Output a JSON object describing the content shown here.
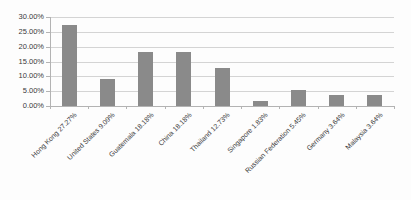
{
  "figure": {
    "background": "#fdfdfd"
  },
  "chart_data": {
    "type": "bar",
    "categories": [
      "Hong Kong 27.27%",
      "United States 9.09%",
      "Guatemala 18.18%",
      "China 18.18%",
      "Thailand 12.73%",
      "Singapore 1.83%",
      "Russian Federation 5.45%",
      "Germany 3.64%",
      "Malaysia 3.64%"
    ],
    "values": [
      27.27,
      9.09,
      18.18,
      18.18,
      12.73,
      1.83,
      5.45,
      3.64,
      3.64
    ],
    "title": "",
    "xlabel": "",
    "ylabel": "",
    "ylim": [
      0,
      30
    ],
    "ytick_step": 5,
    "ytick_labels": [
      "0.00%",
      "5.00%",
      "10.00%",
      "15.00%",
      "20.00%",
      "25.00%",
      "30.00%"
    ],
    "grid": true,
    "legend_position": "none",
    "bar_color": "#8a8a8a",
    "gridline_color": "#d4d4d4",
    "axis_color": "#b3b3b3",
    "tick_color": "#b3b3b3",
    "text_color": "#3a3a3a"
  }
}
